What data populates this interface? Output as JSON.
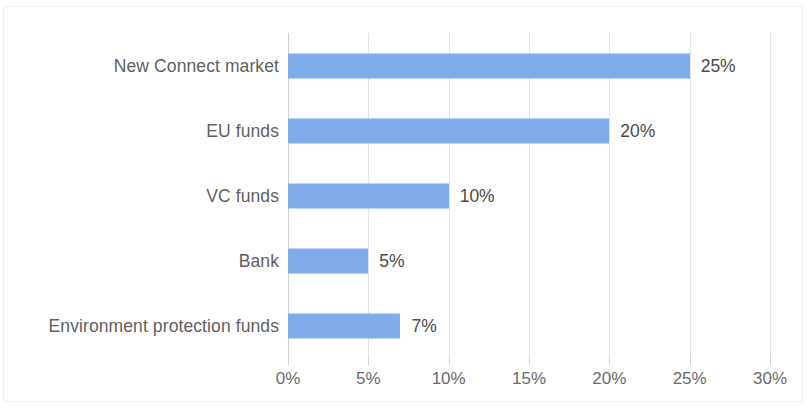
{
  "chart_data": {
    "type": "bar",
    "orientation": "horizontal",
    "title": "",
    "subtitle": "",
    "xlabel": "",
    "ylabel": "",
    "categories": [
      "New Connect market",
      "EU funds",
      "VC funds",
      "Bank",
      "Environment protection funds"
    ],
    "values": [
      25,
      20,
      10,
      5,
      7
    ],
    "value_labels": [
      "25%",
      "20%",
      "10%",
      "5%",
      "7%"
    ],
    "xlim": [
      0,
      30
    ],
    "xtick_values": [
      0,
      5,
      10,
      15,
      20,
      25,
      30
    ],
    "xtick_labels": [
      "0%",
      "5%",
      "10%",
      "15%",
      "20%",
      "25%",
      "30%"
    ],
    "grid": true,
    "grid_axis": "x",
    "legend": false,
    "legend_position": "none",
    "series": [
      {
        "name": "",
        "values": [
          25,
          20,
          10,
          5,
          7
        ],
        "color": "#7facea"
      }
    ]
  },
  "style": {
    "bar_color": "#7facea",
    "gridline_color": "#e4e4e4",
    "axis_color": "#d2d2d2",
    "label_color": "#5f5f5f",
    "value_color": "#4b4b4b",
    "tick_color": "#6a6a6a",
    "background": "#ffffff",
    "frame_color": "#efefef"
  }
}
